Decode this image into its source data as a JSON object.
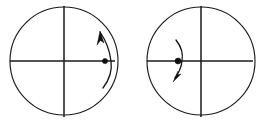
{
  "figure": {
    "title": "Two circular diagrams with crosshair axes and curved motion arrows",
    "background_color": "#ffffff",
    "stroke_color": "#1a1a1a",
    "fill_color": "#101010",
    "width": 265,
    "height": 124,
    "panels": [
      {
        "id": "left-panel",
        "label": "",
        "circle": {
          "center_x": 64,
          "center_y": 61,
          "radius": 54
        },
        "axes": {
          "horizontal": {
            "x1": 10,
            "y1": 61,
            "x2": 115,
            "y2": 61
          },
          "vertical": {
            "x1": 64,
            "y1": 6,
            "x2": 64,
            "y2": 117
          }
        },
        "marker_dot": {
          "name": "point-marker",
          "cx": 105,
          "cy": 61,
          "r": 2.6
        },
        "motion_arc": {
          "name": "curved-motion-arrow",
          "path": "M 103 88 Q 113 75 111 61 Q 109 45 100 32",
          "direction": "counterclockwise-upward",
          "arrow_at": "top"
        },
        "arrow_head": {
          "points": "100,31 104,43 100.5,40.5 97,45",
          "direction": "up"
        }
      },
      {
        "id": "right-panel",
        "label": "",
        "circle": {
          "center_x": 201,
          "center_y": 61,
          "radius": 54
        },
        "axes": {
          "horizontal": {
            "x1": 147,
            "y1": 61,
            "x2": 253,
            "y2": 61
          },
          "vertical": {
            "x1": 201,
            "y1": 6,
            "x2": 201,
            "y2": 117
          }
        },
        "marker_dot": {
          "name": "point-marker",
          "cx": 178,
          "cy": 61,
          "r": 3.0
        },
        "motion_arc": {
          "name": "curved-motion-arrow",
          "path": "M 176 40 Q 184 50 182 61 Q 181 70 175 78",
          "direction": "clockwise-downward",
          "arrow_at": "bottom"
        },
        "arrow_head": {
          "points": "173,82 178,71 177,75 181,74",
          "direction": "down"
        }
      }
    ]
  }
}
